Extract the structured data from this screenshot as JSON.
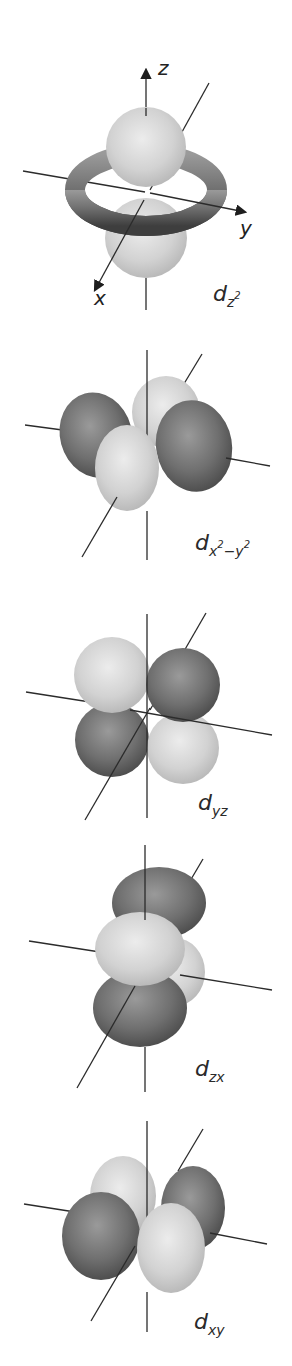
{
  "figure": {
    "colors": {
      "light_lobe": "#d4d4d4",
      "dark_lobe": "#6e6e6e",
      "axis": "#2b2b2b",
      "background": "#ffffff"
    },
    "axis_labels": {
      "x": "x",
      "y": "y",
      "z": "z"
    },
    "orbitals": [
      {
        "id": "dz2",
        "base": "d",
        "sub": "z",
        "sup": "2",
        "sub2": "",
        "sup2": ""
      },
      {
        "id": "dx2y2",
        "base": "d",
        "sub": "x",
        "sup": "2",
        "sub2": "−y",
        "sup2": "2"
      },
      {
        "id": "dyz",
        "base": "d",
        "sub": "yz"
      },
      {
        "id": "dzx",
        "base": "d",
        "sub": "zx"
      },
      {
        "id": "dxy",
        "base": "d",
        "sub": "xy"
      }
    ]
  }
}
